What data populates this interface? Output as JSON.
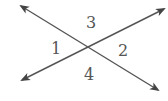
{
  "diagram": {
    "type": "intersecting-lines",
    "stroke_color": "#555555",
    "lines": [
      {
        "name": "line-a",
        "x1": 21,
        "y1": 6,
        "x2": 158,
        "y2": 90
      },
      {
        "name": "line-b",
        "x1": 22,
        "y1": 80,
        "x2": 164,
        "y2": 9
      }
    ],
    "intersection": {
      "x": 89,
      "y": 47
    },
    "angles": [
      {
        "label": "1",
        "x": 56,
        "y": 54
      },
      {
        "label": "2",
        "x": 123,
        "y": 56
      },
      {
        "label": "3",
        "x": 91,
        "y": 28
      },
      {
        "label": "4",
        "x": 89,
        "y": 80
      }
    ]
  }
}
